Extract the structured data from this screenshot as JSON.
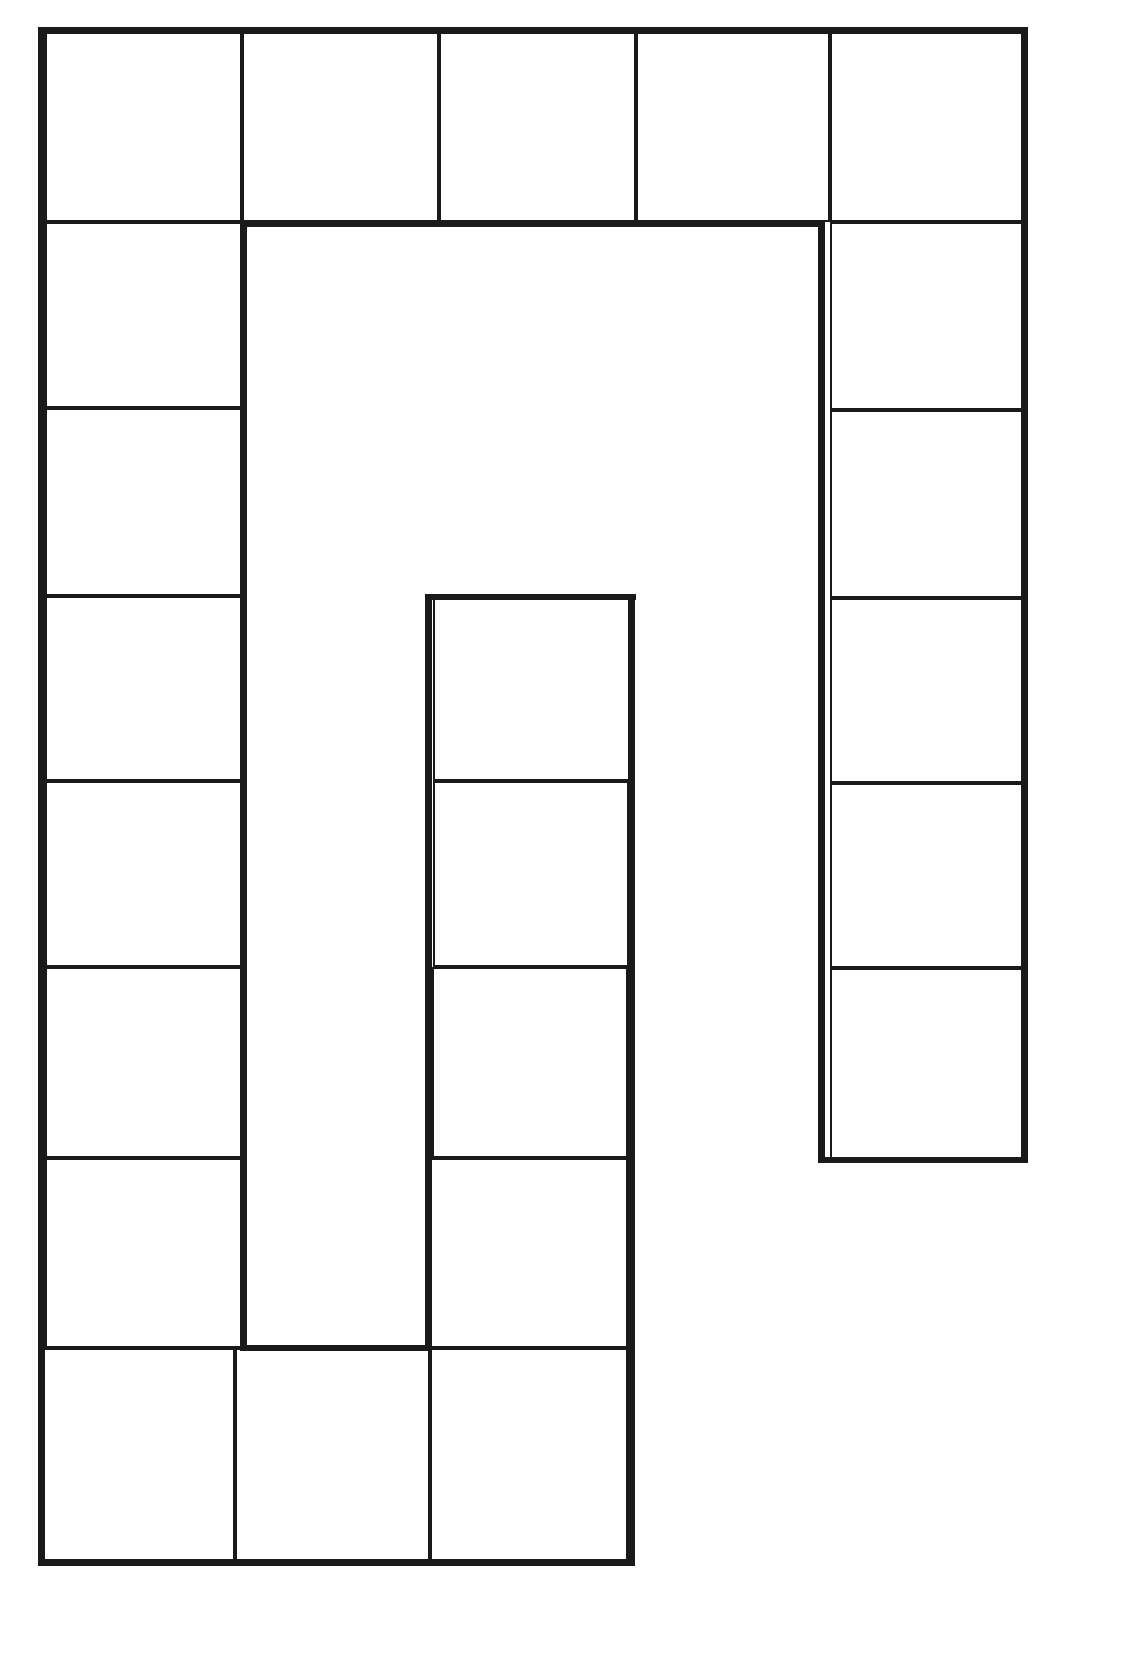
{
  "board": {
    "type": "blank spiral path game board",
    "line_color": "#1a1a1a",
    "background": "#ffffff",
    "cells": [
      {
        "id": 1,
        "x": 45,
        "y": 30,
        "w": 197,
        "h": 192
      },
      {
        "id": 2,
        "x": 242,
        "y": 30,
        "w": 197,
        "h": 192
      },
      {
        "id": 3,
        "x": 439,
        "y": 30,
        "w": 197,
        "h": 192
      },
      {
        "id": 4,
        "x": 636,
        "y": 30,
        "w": 194,
        "h": 192
      },
      {
        "id": 5,
        "x": 830,
        "y": 30,
        "w": 196,
        "h": 192
      },
      {
        "id": 6,
        "x": 830,
        "y": 222,
        "w": 196,
        "h": 188
      },
      {
        "id": 7,
        "x": 830,
        "y": 410,
        "w": 196,
        "h": 188
      },
      {
        "id": 8,
        "x": 830,
        "y": 598,
        "w": 196,
        "h": 185
      },
      {
        "id": 9,
        "x": 830,
        "y": 783,
        "w": 196,
        "h": 185
      },
      {
        "id": 10,
        "x": 830,
        "y": 968,
        "w": 196,
        "h": 192
      },
      {
        "id": 11,
        "x": 45,
        "y": 222,
        "w": 197,
        "h": 186
      },
      {
        "id": 12,
        "x": 45,
        "y": 408,
        "w": 197,
        "h": 188
      },
      {
        "id": 13,
        "x": 45,
        "y": 596,
        "w": 197,
        "h": 185
      },
      {
        "id": 14,
        "x": 45,
        "y": 781,
        "w": 197,
        "h": 186
      },
      {
        "id": 15,
        "x": 45,
        "y": 967,
        "w": 197,
        "h": 191
      },
      {
        "id": 16,
        "x": 45,
        "y": 1158,
        "w": 197,
        "h": 190
      },
      {
        "id": 17,
        "x": 40,
        "y": 1348,
        "w": 195,
        "h": 215
      },
      {
        "id": 18,
        "x": 235,
        "y": 1348,
        "w": 195,
        "h": 215
      },
      {
        "id": 19,
        "x": 430,
        "y": 1348,
        "w": 198,
        "h": 215
      },
      {
        "id": 20,
        "x": 430,
        "y": 1158,
        "w": 198,
        "h": 190
      },
      {
        "id": 21,
        "x": 432,
        "y": 967,
        "w": 196,
        "h": 191
      },
      {
        "id": 22,
        "x": 433,
        "y": 781,
        "w": 196,
        "h": 186
      },
      {
        "id": 23,
        "x": 433,
        "y": 596,
        "w": 200,
        "h": 185
      }
    ],
    "walls": [
      {
        "x": 43,
        "y": 27,
        "w": 985,
        "h": 7
      },
      {
        "x": 1021,
        "y": 27,
        "w": 7,
        "h": 1136
      },
      {
        "x": 818,
        "y": 1157,
        "w": 210,
        "h": 6
      },
      {
        "x": 818,
        "y": 222,
        "w": 7,
        "h": 940
      },
      {
        "x": 240,
        "y": 220,
        "w": 585,
        "h": 7
      },
      {
        "x": 240,
        "y": 220,
        "w": 7,
        "h": 1130
      },
      {
        "x": 240,
        "y": 1345,
        "w": 190,
        "h": 6
      },
      {
        "x": 425,
        "y": 594,
        "w": 7,
        "h": 756
      },
      {
        "x": 429,
        "y": 594,
        "w": 207,
        "h": 6
      },
      {
        "x": 628,
        "y": 594,
        "w": 7,
        "h": 970
      },
      {
        "x": 38,
        "y": 1559,
        "w": 597,
        "h": 7
      },
      {
        "x": 38,
        "y": 27,
        "w": 7,
        "h": 1538
      }
    ]
  }
}
